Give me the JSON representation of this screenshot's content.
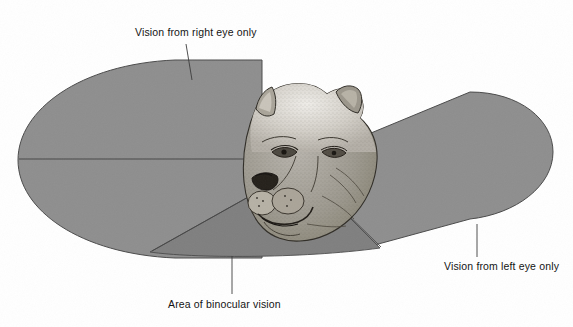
{
  "figure": {
    "background_color": "#ffffff",
    "line_color": "#3a3a3a",
    "text_color": "#141414"
  },
  "regions": {
    "right_eye_field": {
      "label": "Vision from right eye only",
      "fill": "#8e8e8e"
    },
    "left_eye_field": {
      "label": "Vision from left eye only",
      "fill": "#8e8e8e"
    },
    "binocular_field": {
      "label": "Area of binocular vision",
      "fill": "#7b7b7b"
    }
  },
  "labels": [
    {
      "name": "right-eye-label",
      "text": "Vision from right eye only"
    },
    {
      "name": "left-eye-label",
      "text": "Vision from left eye only"
    },
    {
      "name": "binocular-label",
      "text": "Area of binocular vision"
    }
  ],
  "animal": {
    "name": "lioness-head-illustration",
    "description": "stippled ink drawing of a lioness head facing left"
  }
}
